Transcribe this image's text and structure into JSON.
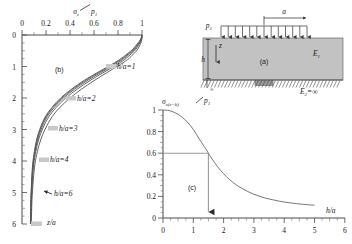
{
  "figure": {
    "panels": [
      "(a)",
      "(b)",
      "(c)"
    ],
    "panel_a_label": "(a)",
    "panel_b_label": "(b)",
    "panel_c_label": "(c)"
  },
  "diagram_a": {
    "load_label": "p",
    "load_sub": "1",
    "width_label": "a",
    "depth_label": "h",
    "depth_axis_label": "z",
    "modulus_top": "E",
    "modulus_top_sub": "1",
    "modulus_base": "E",
    "modulus_base_sub": "2",
    "modulus_base_value": "=∞",
    "left_support_label": "∞",
    "n_load_arrows": 13
  },
  "chart_data": [
    {
      "id": "panel_b",
      "type": "line",
      "title": "(b)",
      "xlabel": "σz/p1",
      "ylabel": "z/a",
      "xlim": [
        0,
        1
      ],
      "ylim": [
        6,
        0
      ],
      "x_axis_position": "top",
      "y_axis_direction": "down",
      "xticks": [
        0,
        0.2,
        0.4,
        0.6,
        0.8,
        1
      ],
      "xtick_labels": [
        "0",
        "0.2",
        "0.4",
        "0.6",
        "0.8",
        "1"
      ],
      "yticks": [
        0,
        1,
        2,
        3,
        4,
        5,
        6
      ],
      "ytick_labels": [
        "0",
        "1",
        "2",
        "3",
        "4",
        "5",
        "6"
      ],
      "grid": false,
      "legend": "inline-annotations",
      "annotations": [
        {
          "text": "h/a=1",
          "x": 0.82,
          "y": 1.15
        },
        {
          "text": "h/a=2",
          "x": 0.46,
          "y": 2.15
        },
        {
          "text": "h/a=3",
          "x": 0.3,
          "y": 3.05
        },
        {
          "text": "h/a=4",
          "x": 0.22,
          "y": 4.05
        },
        {
          "text": "h/a=6",
          "x": 0.23,
          "y": 5.05
        }
      ],
      "series": [
        {
          "name": "h/a=1",
          "x": [
            1.0,
            1.0,
            0.995,
            0.985,
            0.965,
            0.93,
            0.88,
            0.8,
            0.705,
            0.6,
            0.495,
            0.4,
            0.315,
            0.25,
            0.198,
            0.158,
            0.128,
            0.108,
            0.094,
            0.085,
            0.08,
            0.078
          ],
          "y": [
            0,
            0.1,
            0.2,
            0.3,
            0.45,
            0.6,
            0.78,
            0.98,
            1.2,
            1.45,
            1.72,
            2.0,
            2.3,
            2.6,
            2.95,
            3.3,
            3.7,
            4.1,
            4.6,
            5.1,
            5.6,
            6.0
          ]
        },
        {
          "name": "h/a=2",
          "x": [
            1.0,
            0.998,
            0.99,
            0.975,
            0.95,
            0.91,
            0.855,
            0.775,
            0.675,
            0.565,
            0.46,
            0.365,
            0.285,
            0.222,
            0.175,
            0.14,
            0.115,
            0.098,
            0.087,
            0.08,
            0.076,
            0.074
          ],
          "y": [
            0,
            0.1,
            0.2,
            0.3,
            0.45,
            0.6,
            0.78,
            0.98,
            1.2,
            1.45,
            1.72,
            2.0,
            2.3,
            2.6,
            2.95,
            3.3,
            3.7,
            4.1,
            4.6,
            5.1,
            5.6,
            6.0
          ]
        },
        {
          "name": "h/a=3",
          "x": [
            1.0,
            0.996,
            0.986,
            0.968,
            0.94,
            0.897,
            0.838,
            0.755,
            0.653,
            0.543,
            0.438,
            0.345,
            0.268,
            0.208,
            0.164,
            0.132,
            0.109,
            0.094,
            0.084,
            0.078,
            0.074,
            0.072
          ],
          "y": [
            0,
            0.1,
            0.2,
            0.3,
            0.45,
            0.6,
            0.78,
            0.98,
            1.2,
            1.45,
            1.72,
            2.0,
            2.3,
            2.6,
            2.95,
            3.3,
            3.7,
            4.1,
            4.6,
            5.1,
            5.6,
            6.0
          ]
        },
        {
          "name": "h/a=4",
          "x": [
            1.0,
            0.994,
            0.982,
            0.962,
            0.932,
            0.886,
            0.825,
            0.74,
            0.637,
            0.527,
            0.423,
            0.332,
            0.257,
            0.199,
            0.157,
            0.127,
            0.106,
            0.092,
            0.082,
            0.076,
            0.073,
            0.071
          ],
          "y": [
            0,
            0.1,
            0.2,
            0.3,
            0.45,
            0.6,
            0.78,
            0.98,
            1.2,
            1.45,
            1.72,
            2.0,
            2.3,
            2.6,
            2.95,
            3.3,
            3.7,
            4.1,
            4.6,
            5.1,
            5.6,
            6.0
          ]
        },
        {
          "name": "h/a=6",
          "x": [
            1.0,
            0.992,
            0.978,
            0.956,
            0.924,
            0.876,
            0.813,
            0.727,
            0.624,
            0.514,
            0.412,
            0.322,
            0.249,
            0.193,
            0.152,
            0.123,
            0.103,
            0.089,
            0.08,
            0.075,
            0.072,
            0.07
          ],
          "y": [
            0,
            0.1,
            0.2,
            0.3,
            0.45,
            0.6,
            0.78,
            0.98,
            1.2,
            1.45,
            1.72,
            2.0,
            2.3,
            2.6,
            2.95,
            3.3,
            3.7,
            4.1,
            4.6,
            5.1,
            5.6,
            6.0
          ]
        }
      ]
    },
    {
      "id": "panel_c",
      "type": "line",
      "title": "(c)",
      "xlabel": "h/a",
      "ylabel": "σz(z=h)/p1",
      "xlim": [
        0,
        6
      ],
      "ylim": [
        0,
        1
      ],
      "xticks": [
        0,
        1,
        2,
        3,
        4,
        5,
        6
      ],
      "xtick_labels": [
        "0",
        "1",
        "2",
        "3",
        "4",
        "5",
        "6"
      ],
      "yticks": [
        0,
        0.2,
        0.4,
        0.6,
        0.8,
        1
      ],
      "ytick_labels": [
        "0",
        "0.2",
        "0.4",
        "0.6",
        "0.8",
        "1"
      ],
      "grid": false,
      "annotations": [
        {
          "type": "hline",
          "y": 0.6,
          "x_from": 0,
          "x_to": 1.5
        },
        {
          "type": "vline-arrow",
          "x": 1.5,
          "y_from": 0.6,
          "y_to": 0.0
        }
      ],
      "marker_x": 1.5,
      "marker_y": 0.6,
      "x": [
        0,
        0.2,
        0.4,
        0.6,
        0.8,
        1.0,
        1.2,
        1.4,
        1.5,
        1.6,
        1.8,
        2.0,
        2.2,
        2.4,
        2.6,
        2.8,
        3.0,
        3.2,
        3.4,
        3.6,
        3.8,
        4.0,
        4.2,
        4.4,
        4.6,
        4.8,
        5.0
      ],
      "y": [
        1.0,
        0.995,
        0.975,
        0.94,
        0.89,
        0.82,
        0.73,
        0.645,
        0.6,
        0.555,
        0.475,
        0.41,
        0.355,
        0.31,
        0.275,
        0.245,
        0.22,
        0.2,
        0.183,
        0.17,
        0.158,
        0.148,
        0.14,
        0.133,
        0.127,
        0.122,
        0.118
      ]
    }
  ]
}
